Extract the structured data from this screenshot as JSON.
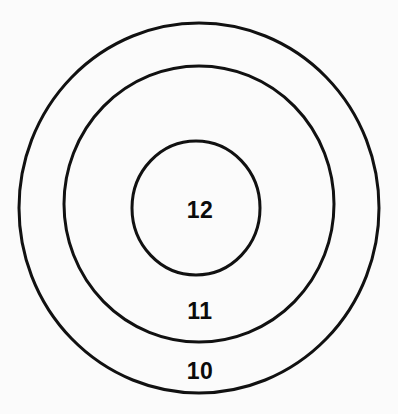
{
  "diagram": {
    "type": "concentric-circles",
    "background_color": "#fbfbfb",
    "stroke_color": "#111111",
    "label_color": "#0b0b0b",
    "rings": [
      {
        "id": "outer-ring",
        "label": "10",
        "cx": 199,
        "cy": 208,
        "rx": 180,
        "ry": 185,
        "stroke_width": 3,
        "label_x": 200,
        "label_y": 379
      },
      {
        "id": "middle-ring",
        "label": "11",
        "cx": 199,
        "cy": 204,
        "rx": 135,
        "ry": 138,
        "stroke_width": 3,
        "label_x": 200,
        "label_y": 319
      },
      {
        "id": "inner-circle",
        "label": "12",
        "cx": 196,
        "cy": 208,
        "rx": 64,
        "ry": 67,
        "stroke_width": 3,
        "label_x": 200,
        "label_y": 218
      }
    ]
  }
}
